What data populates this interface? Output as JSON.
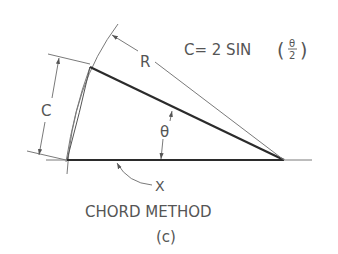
{
  "figure": {
    "formula": {
      "prefix": "C= 2 SIN",
      "open_paren": "(",
      "numerator": "θ",
      "denominator": "2",
      "close_paren": ")"
    },
    "labels": {
      "radius": "R",
      "chord": "C",
      "angle": "θ",
      "distance": "X"
    },
    "caption": "CHORD METHOD",
    "subcaption": "(c)"
  },
  "colors": {
    "line_heavy": "#2b2b2b",
    "line_light": "#7a7a7a",
    "text": "#555555",
    "background": "#ffffff"
  }
}
